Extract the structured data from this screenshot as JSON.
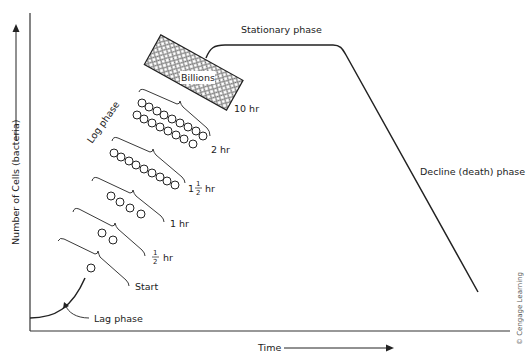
{
  "diagram": {
    "y_axis_label": "Number of Cells (bacteria)",
    "x_axis_label": "Time",
    "phases": {
      "lag": "Lag phase",
      "log": "Log phase",
      "stationary": "Stationary phase",
      "decline": "Decline (death) phase"
    },
    "block_label": "Billions",
    "time_labels": {
      "start": "Start",
      "half": "hr",
      "one": "1 hr",
      "one_half_whole": "1",
      "one_half_unit": "hr",
      "two": "2 hr",
      "ten": "10 hr"
    },
    "fraction": {
      "num": "1",
      "den": "2"
    },
    "credit": "© Cengage Learning"
  }
}
